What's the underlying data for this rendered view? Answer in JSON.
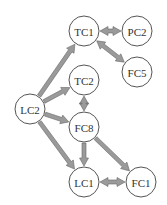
{
  "diagram": {
    "type": "directed-graph",
    "colors": {
      "node_fill": "#ffffff",
      "node_stroke": "#555555",
      "edge_fill": "#9a9a9a",
      "text": "#333333"
    },
    "nodes": [
      {
        "id": "TC1",
        "label": "TC1"
      },
      {
        "id": "PC2",
        "label": "PC2"
      },
      {
        "id": "FC5",
        "label": "FC5"
      },
      {
        "id": "TC2",
        "label": "TC2"
      },
      {
        "id": "LC2",
        "label": "LC2"
      },
      {
        "id": "FC8",
        "label": "FC8"
      },
      {
        "id": "LC1",
        "label": "LC1"
      },
      {
        "id": "FC1",
        "label": "FC1"
      }
    ],
    "edges": [
      {
        "from": "LC2",
        "to": "TC1",
        "bidirectional": false
      },
      {
        "from": "LC2",
        "to": "TC2",
        "bidirectional": false
      },
      {
        "from": "LC2",
        "to": "FC8",
        "bidirectional": false
      },
      {
        "from": "LC2",
        "to": "LC1",
        "bidirectional": false
      },
      {
        "from": "TC1",
        "to": "PC2",
        "bidirectional": true
      },
      {
        "from": "TC1",
        "to": "FC5",
        "bidirectional": true
      },
      {
        "from": "TC2",
        "to": "FC8",
        "bidirectional": true
      },
      {
        "from": "FC8",
        "to": "LC1",
        "bidirectional": false
      },
      {
        "from": "FC8",
        "to": "FC1",
        "bidirectional": false
      },
      {
        "from": "LC1",
        "to": "FC1",
        "bidirectional": true
      }
    ]
  }
}
